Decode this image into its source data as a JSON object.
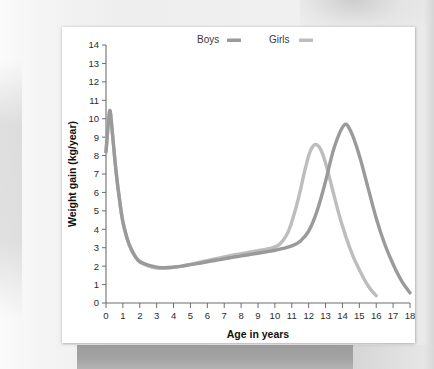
{
  "chart_data": {
    "type": "line",
    "title": "",
    "xlabel": "Age in years",
    "ylabel": "Weight gain (kg/year)",
    "xlim": [
      0,
      18
    ],
    "ylim": [
      0,
      14
    ],
    "xticks": [
      0,
      1,
      2,
      3,
      4,
      5,
      6,
      7,
      8,
      9,
      10,
      11,
      12,
      13,
      14,
      15,
      16,
      17,
      18
    ],
    "yticks": [
      0,
      1,
      2,
      3,
      4,
      5,
      6,
      7,
      8,
      9,
      10,
      11,
      12,
      13,
      14
    ],
    "grid": false,
    "legend_position": "top-center",
    "series": [
      {
        "name": "Boys",
        "color": "#9a9a9a",
        "x": [
          0,
          0.15,
          0.25,
          0.4,
          0.6,
          0.8,
          1.0,
          1.25,
          1.5,
          1.75,
          2.0,
          2.5,
          3.0,
          3.5,
          4.0,
          4.5,
          5.0,
          5.5,
          6.0,
          6.5,
          7.0,
          7.5,
          8.0,
          8.5,
          9.0,
          9.5,
          10.0,
          10.5,
          11.0,
          11.5,
          12.0,
          12.5,
          13.0,
          13.5,
          14.1,
          14.5,
          15.0,
          15.5,
          16.0,
          16.5,
          17.0,
          17.5,
          18.0
        ],
        "y": [
          8.2,
          9.9,
          10.4,
          9.0,
          7.1,
          5.6,
          4.4,
          3.5,
          2.9,
          2.5,
          2.25,
          2.05,
          1.95,
          1.92,
          1.95,
          2.0,
          2.08,
          2.15,
          2.24,
          2.32,
          2.4,
          2.48,
          2.56,
          2.63,
          2.7,
          2.78,
          2.86,
          2.96,
          3.1,
          3.35,
          3.9,
          5.0,
          6.6,
          8.4,
          9.65,
          9.3,
          8.0,
          6.3,
          4.6,
          3.2,
          2.1,
          1.2,
          0.55
        ]
      },
      {
        "name": "Girls",
        "color": "#bdbdbd",
        "x": [
          0,
          0.15,
          0.25,
          0.4,
          0.6,
          0.8,
          1.0,
          1.25,
          1.5,
          1.75,
          2.0,
          2.5,
          3.0,
          3.5,
          4.0,
          4.5,
          5.0,
          5.5,
          6.0,
          6.5,
          7.0,
          7.5,
          8.0,
          8.5,
          9.0,
          9.5,
          10.0,
          10.3,
          10.7,
          11.0,
          11.4,
          11.8,
          12.1,
          12.4,
          12.7,
          13.0,
          13.4,
          13.8,
          14.2,
          14.6,
          15.0,
          15.4,
          15.7,
          16.0
        ],
        "y": [
          8.2,
          9.9,
          10.4,
          9.0,
          7.1,
          5.6,
          4.4,
          3.5,
          2.9,
          2.5,
          2.22,
          2.02,
          1.9,
          1.88,
          1.93,
          2.0,
          2.1,
          2.2,
          2.3,
          2.4,
          2.5,
          2.6,
          2.68,
          2.76,
          2.84,
          2.92,
          3.05,
          3.2,
          3.7,
          4.4,
          5.7,
          7.3,
          8.25,
          8.6,
          8.35,
          7.6,
          6.2,
          4.8,
          3.6,
          2.6,
          1.8,
          1.1,
          0.7,
          0.4
        ]
      }
    ],
    "legend": [
      {
        "label": "Boys",
        "color": "#9a9a9a"
      },
      {
        "label": "Girls",
        "color": "#bdbdbd"
      }
    ]
  }
}
